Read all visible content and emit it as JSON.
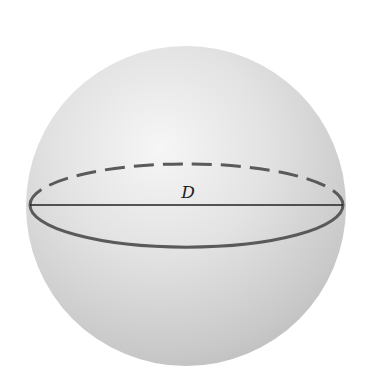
{
  "diagram": {
    "type": "sphere",
    "shape": "sphere",
    "center": [
      186,
      206
    ],
    "radius": 160,
    "equator": {
      "rx": 156,
      "ry": 41,
      "back_style": "dashed",
      "front_style": "solid"
    },
    "diameter": {
      "label": "D",
      "from": [
        30,
        205
      ],
      "to": [
        343,
        205
      ]
    },
    "colors": {
      "sphere_light": "#f4f4f4",
      "sphere_mid": "#dcdcdc",
      "sphere_dark": "#bdbdbd",
      "equator_line": "#5a5a5a",
      "diameter_line": "#222222",
      "label": "#222222"
    }
  }
}
